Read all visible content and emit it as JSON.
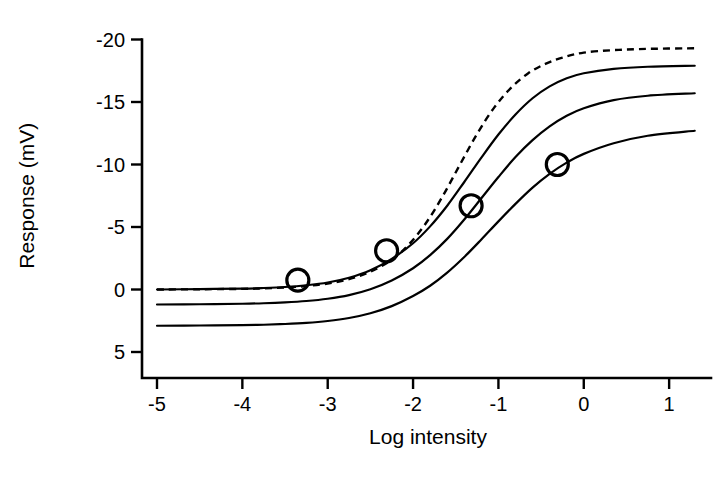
{
  "chart_data": {
    "type": "line",
    "title": "",
    "xlabel": "Log intensity",
    "ylabel": "Response (mV)",
    "xlim": [
      -5,
      1.35
    ],
    "ylim": [
      -20.8,
      5.6
    ],
    "y_axis_inverted": true,
    "grid": false,
    "legend": "none",
    "xticks": [
      -5,
      -4,
      -3,
      -2,
      -1,
      0,
      1
    ],
    "xticklabels": [
      "-5",
      "-4",
      "-3",
      "-2",
      "-1",
      "0",
      "1"
    ],
    "yticks": [
      -20,
      -15,
      -10,
      -5,
      0,
      5
    ],
    "yticklabels": [
      "-20",
      "-15",
      "-10",
      "-5",
      "0",
      "5"
    ],
    "series": [
      {
        "name": "dark-adapted (dashed reference)",
        "style": "dashed",
        "baseline": 0.0,
        "vmax": -19.3,
        "half_saturation": -2.05,
        "slope": 1.05,
        "points": [
          [
            -5.0,
            0.0
          ],
          [
            -4.5,
            -0.02
          ],
          [
            -4.0,
            -0.05
          ],
          [
            -3.75,
            -0.09
          ],
          [
            -3.5,
            -0.16
          ],
          [
            -3.25,
            -0.28
          ],
          [
            -3.0,
            -0.48
          ],
          [
            -2.75,
            -0.83
          ],
          [
            -2.5,
            -1.42
          ],
          [
            -2.25,
            -2.38
          ],
          [
            -2.05,
            -3.6
          ],
          [
            -1.85,
            -5.3
          ],
          [
            -1.65,
            -7.5
          ],
          [
            -1.45,
            -10.0
          ],
          [
            -1.25,
            -12.45
          ],
          [
            -1.05,
            -14.55
          ],
          [
            -0.85,
            -16.15
          ],
          [
            -0.65,
            -17.3
          ],
          [
            -0.45,
            -18.05
          ],
          [
            -0.25,
            -18.55
          ],
          [
            0.0,
            -18.95
          ],
          [
            0.35,
            -19.15
          ],
          [
            0.75,
            -19.25
          ],
          [
            1.3,
            -19.3
          ]
        ]
      },
      {
        "name": "curve 1",
        "style": "solid",
        "baseline": 0.0,
        "vmax": -17.9,
        "half_saturation": -1.85,
        "slope": 1.0,
        "points": [
          [
            -5.0,
            0.0
          ],
          [
            -4.5,
            -0.03
          ],
          [
            -4.0,
            -0.07
          ],
          [
            -3.75,
            -0.12
          ],
          [
            -3.5,
            -0.2
          ],
          [
            -3.25,
            -0.34
          ],
          [
            -3.0,
            -0.56
          ],
          [
            -2.75,
            -0.94
          ],
          [
            -2.5,
            -1.54
          ],
          [
            -2.25,
            -2.45
          ],
          [
            -2.0,
            -3.7
          ],
          [
            -1.8,
            -5.05
          ],
          [
            -1.6,
            -6.7
          ],
          [
            -1.4,
            -8.6
          ],
          [
            -1.2,
            -10.55
          ],
          [
            -1.0,
            -12.4
          ],
          [
            -0.8,
            -14.0
          ],
          [
            -0.6,
            -15.3
          ],
          [
            -0.4,
            -16.25
          ],
          [
            -0.2,
            -16.9
          ],
          [
            0.0,
            -17.3
          ],
          [
            0.35,
            -17.65
          ],
          [
            0.75,
            -17.82
          ],
          [
            1.3,
            -17.9
          ]
        ]
      },
      {
        "name": "curve 2",
        "style": "solid",
        "baseline": 1.2,
        "vmax": -15.7,
        "half_saturation": -1.45,
        "slope": 0.95,
        "points": [
          [
            -5.0,
            1.2
          ],
          [
            -4.5,
            1.18
          ],
          [
            -4.0,
            1.14
          ],
          [
            -3.75,
            1.1
          ],
          [
            -3.5,
            1.03
          ],
          [
            -3.25,
            0.92
          ],
          [
            -3.0,
            0.74
          ],
          [
            -2.75,
            0.45
          ],
          [
            -2.5,
            -0.02
          ],
          [
            -2.25,
            -0.72
          ],
          [
            -2.0,
            -1.7
          ],
          [
            -1.8,
            -2.75
          ],
          [
            -1.6,
            -4.05
          ],
          [
            -1.4,
            -5.6
          ],
          [
            -1.2,
            -7.3
          ],
          [
            -1.0,
            -9.0
          ],
          [
            -0.8,
            -10.6
          ],
          [
            -0.6,
            -11.95
          ],
          [
            -0.4,
            -13.05
          ],
          [
            -0.2,
            -13.9
          ],
          [
            0.0,
            -14.5
          ],
          [
            0.35,
            -15.15
          ],
          [
            0.75,
            -15.5
          ],
          [
            1.3,
            -15.7
          ]
        ]
      },
      {
        "name": "curve 3",
        "style": "solid",
        "baseline": 2.9,
        "vmax": -12.7,
        "half_saturation": -0.95,
        "slope": 0.92,
        "points": [
          [
            -5.0,
            2.9
          ],
          [
            -4.5,
            2.88
          ],
          [
            -4.0,
            2.85
          ],
          [
            -3.75,
            2.82
          ],
          [
            -3.5,
            2.76
          ],
          [
            -3.25,
            2.67
          ],
          [
            -3.0,
            2.52
          ],
          [
            -2.75,
            2.28
          ],
          [
            -2.5,
            1.9
          ],
          [
            -2.25,
            1.33
          ],
          [
            -2.0,
            0.52
          ],
          [
            -1.8,
            -0.3
          ],
          [
            -1.6,
            -1.35
          ],
          [
            -1.4,
            -2.6
          ],
          [
            -1.2,
            -4.0
          ],
          [
            -1.0,
            -5.45
          ],
          [
            -0.8,
            -6.85
          ],
          [
            -0.6,
            -8.15
          ],
          [
            -0.4,
            -9.25
          ],
          [
            -0.2,
            -10.15
          ],
          [
            0.0,
            -10.85
          ],
          [
            0.35,
            -11.7
          ],
          [
            0.75,
            -12.3
          ],
          [
            1.3,
            -12.7
          ]
        ]
      }
    ],
    "markers": {
      "shape": "open-circle",
      "radius_px": 11,
      "points": [
        {
          "x": -3.35,
          "y": -0.75,
          "on_series": "curve 1"
        },
        {
          "x": -2.31,
          "y": -3.1,
          "on_series": "curve 1"
        },
        {
          "x": -1.32,
          "y": -6.7,
          "on_series": "curve 2"
        },
        {
          "x": -0.31,
          "y": -10.0,
          "on_series": "curve 3"
        }
      ]
    }
  },
  "axes": {
    "x_title": "Log intensity",
    "y_title": "Response (mV)"
  }
}
